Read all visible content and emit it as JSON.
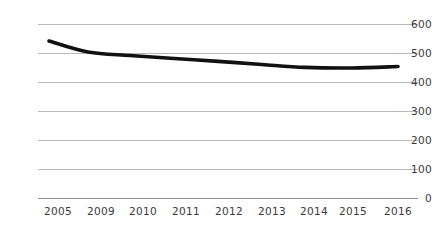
{
  "chart_data": {
    "type": "line",
    "title": "",
    "subtitle": "",
    "xlabel": "",
    "ylabel": "",
    "categories": [
      "2005",
      "2009",
      "2010",
      "2011",
      "2012",
      "2013",
      "2014",
      "2015",
      "2016"
    ],
    "values": [
      543,
      505,
      493,
      483,
      473,
      462,
      452,
      450,
      455
    ],
    "series": [
      {
        "name": "",
        "values": [
          543,
          505,
          493,
          483,
          473,
          462,
          452,
          450,
          455
        ]
      }
    ],
    "xtick_labels": [
      "2005",
      "2009",
      "2010",
      "2011",
      "2012",
      "2013",
      "2014",
      "2015",
      "2016"
    ],
    "ytick_labels": [
      "600",
      "500",
      "400",
      "300",
      "200",
      "100",
      "0"
    ],
    "ytick_values": [
      600,
      500,
      400,
      300,
      200,
      100,
      0
    ],
    "ylim": [
      0,
      600
    ],
    "grid": true,
    "grid_axis": "y",
    "legend": false,
    "legend_position": "none",
    "annotations": [],
    "colors": {
      "line": "#111111",
      "grid": "#b9b9b9",
      "tick_text": "#3a3a3a",
      "background": "#ffffff"
    }
  }
}
